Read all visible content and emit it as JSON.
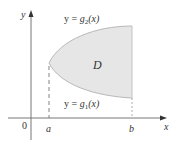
{
  "diagram": {
    "axes": {
      "x_label": "x",
      "y_label": "y",
      "origin_label": "0"
    },
    "ticks": {
      "a": "a",
      "b": "b"
    },
    "region": {
      "label": "D",
      "fill": "#e6e6e6",
      "stroke": "#b8b8b8"
    },
    "curves": {
      "upper": {
        "prefix": "y = ",
        "func": "g",
        "sub": "2",
        "arg": "(x)"
      },
      "lower": {
        "prefix": "y = ",
        "func": "g",
        "sub": "1",
        "arg": "(x)"
      }
    },
    "colors": {
      "axis": "#555555",
      "dashed": "#777777",
      "text": "#333333"
    }
  }
}
